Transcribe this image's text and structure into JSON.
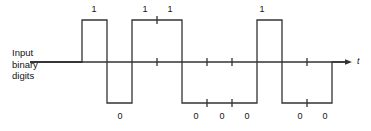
{
  "figure": {
    "caption_lines": [
      "Input",
      "binary",
      "digits"
    ],
    "axis_label": "t",
    "stroke_color": "#333333",
    "text_color": "#141414",
    "background": "#ffffff"
  },
  "chart_data": {
    "type": "line",
    "title": "",
    "xlabel": "t",
    "ylabel": "Input binary digits",
    "bit_sequence": [
      "1",
      "0",
      "1",
      "1",
      "0",
      "0",
      "0",
      "1",
      "0",
      "0"
    ],
    "levels": [
      1,
      -1,
      1,
      1,
      -1,
      -1,
      -1,
      1,
      -1,
      -1
    ],
    "bit_count": 10,
    "bit_start_x": 82,
    "bit_width": 25,
    "level_high_y": 20,
    "level_zero_y": 62,
    "level_low_y": 103,
    "baseline_start_x": 30,
    "axis_end_x": 348,
    "arrow_tip_x": 352,
    "tick_half_length": 4,
    "top_labels": [
      {
        "text": "1",
        "x": 94,
        "y": 5
      },
      {
        "text": "1",
        "x": 145,
        "y": 5
      },
      {
        "text": "1",
        "x": 170,
        "y": 5
      },
      {
        "text": "1",
        "x": 262,
        "y": 5
      }
    ],
    "bottom_labels": [
      {
        "text": "0",
        "x": 120,
        "y": 112
      },
      {
        "text": "0",
        "x": 196,
        "y": 112
      },
      {
        "text": "0",
        "x": 222,
        "y": 112
      },
      {
        "text": "0",
        "x": 247,
        "y": 112
      },
      {
        "text": "0",
        "x": 300,
        "y": 112
      },
      {
        "text": "0",
        "x": 325,
        "y": 112
      }
    ],
    "axis_label_pos": {
      "x": 357,
      "y": 57
    },
    "caption_pos": {
      "x": 12,
      "y": 47
    }
  }
}
